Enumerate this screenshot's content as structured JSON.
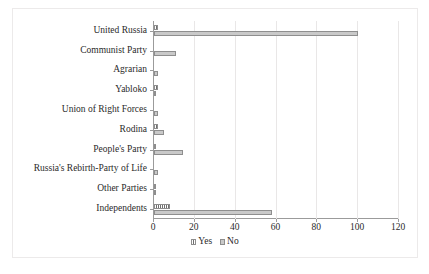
{
  "chart_data": {
    "type": "bar",
    "orientation": "horizontal",
    "title": "",
    "xlabel": "",
    "ylabel": "",
    "xlim": [
      0,
      120
    ],
    "xticks": [
      0,
      20,
      40,
      60,
      80,
      100,
      120
    ],
    "grid": true,
    "legend_position": "bottom",
    "categories": [
      "United Russia",
      "Communist Party",
      "Agrarian",
      "Yabloko",
      "Union of Right Forces",
      "Rodina",
      "People's Party",
      "Russia's Rebirth-Party of Life",
      "Other Parties",
      "Independents"
    ],
    "series": [
      {
        "name": "Yes",
        "color": "#6f6f6f",
        "values": [
          2,
          0,
          0,
          2,
          0,
          2,
          1,
          0,
          1,
          8
        ]
      },
      {
        "name": "No",
        "color": "#c9c9c9",
        "values": [
          100,
          11,
          2,
          1,
          2,
          5,
          14,
          2,
          1,
          58
        ]
      }
    ]
  },
  "legend": {
    "items": [
      {
        "label": "Yes"
      },
      {
        "label": "No"
      }
    ]
  },
  "axis": {
    "x_tick_labels": [
      "0",
      "20",
      "40",
      "60",
      "80",
      "100",
      "120"
    ]
  }
}
